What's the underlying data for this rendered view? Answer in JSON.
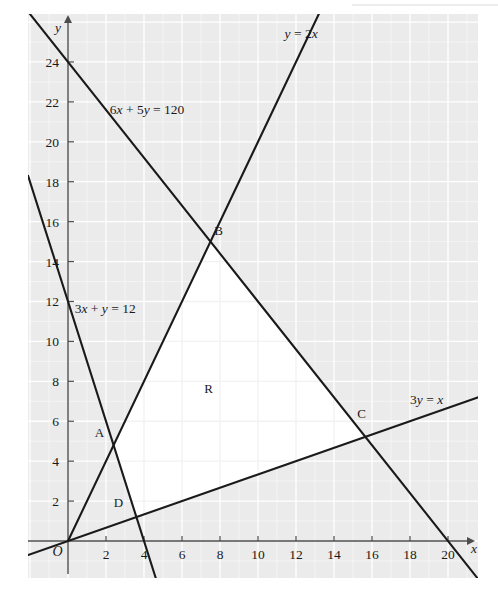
{
  "chart_data": {
    "type": "line",
    "title": "",
    "xlabel": "x",
    "ylabel": "y",
    "xlim": [
      -2.1,
      21.6
    ],
    "ylim": [
      -1.35,
      26.4
    ],
    "grid": true,
    "minor_grid": true,
    "legend": "none",
    "xticks": [
      0,
      2,
      4,
      6,
      8,
      10,
      12,
      14,
      16,
      18,
      20
    ],
    "xtick_labels": [
      "O",
      "2",
      "4",
      "6",
      "8",
      "10",
      "12",
      "14",
      "16",
      "18",
      "20"
    ],
    "yticks": [
      2,
      4,
      6,
      8,
      10,
      12,
      14,
      16,
      18,
      20,
      22,
      24
    ],
    "ytick_labels": [
      "2",
      "4",
      "6",
      "8",
      "10",
      "12",
      "14",
      "16",
      "18",
      "20",
      "22",
      "24"
    ],
    "series": [
      {
        "name": "y = 2x",
        "label": "y = 2x",
        "label_parts": {
          "lhs": "y",
          "eq": "=",
          "rhs_coef": "2",
          "rhs_var": "x"
        },
        "equation": "y = 2x",
        "slope": 2,
        "intercept": 0,
        "points": [
          [
            0,
            0
          ],
          [
            13.2,
            26.4
          ]
        ],
        "label_xy": [
          11.4,
          25.2
        ]
      },
      {
        "name": "6x + 5y = 120",
        "label": "6x + 5y = 120",
        "label_parts": {
          "a": "6",
          "av": "x",
          "plus": "+",
          "b": "5",
          "bv": "y",
          "eq": "=",
          "c": "120"
        },
        "equation": "6x + 5y = 120",
        "slope": -1.2,
        "intercept": 24,
        "points": [
          [
            -2.1,
            26.52
          ],
          [
            21.6,
            -1.92
          ]
        ],
        "label_xy": [
          2.2,
          21.4
        ]
      },
      {
        "name": "3x + y = 12",
        "label": "3x + y = 12",
        "label_parts": {
          "a": "3",
          "av": "x",
          "plus": "+",
          "bv": "y",
          "eq": "=",
          "c": "12"
        },
        "equation": "3x + y = 12",
        "slope": -3,
        "intercept": 12,
        "points": [
          [
            -2.1,
            18.3
          ],
          [
            5.0,
            -3.0
          ]
        ],
        "label_xy": [
          0.35,
          11.4
        ]
      },
      {
        "name": "3y = x",
        "label": "3y = x",
        "label_parts": {
          "a": "3",
          "av": "y",
          "eq": "=",
          "bv": "x"
        },
        "equation": "3y = x",
        "slope": 0.3333,
        "intercept": 0,
        "points": [
          [
            -2.1,
            -0.7
          ],
          [
            21.6,
            7.2
          ]
        ],
        "label_xy": [
          18.0,
          6.85
        ]
      }
    ],
    "region": {
      "label": "R",
      "label_xy": [
        7.4,
        7.4
      ],
      "fill": "#ffffff",
      "vertices": [
        {
          "name": "A",
          "x": 2.4,
          "y": 4.8,
          "label_offset": [
            -0.75,
            0.42
          ]
        },
        {
          "name": "B",
          "x": 7.5,
          "y": 15.0,
          "label_offset": [
            0.42,
            0.32
          ]
        },
        {
          "name": "C",
          "x": 15.652,
          "y": 5.217,
          "label_offset": [
            -0.2,
            0.95
          ]
        },
        {
          "name": "D",
          "x": 3.6,
          "y": 1.2,
          "label_offset": [
            -0.95,
            0.48
          ]
        }
      ]
    },
    "annotations": [
      {
        "text": "O",
        "role": "origin-label",
        "x": -0.55,
        "y": -0.75
      }
    ],
    "colors": {
      "plot_background": "#ebebeb",
      "region_fill": "#ffffff",
      "major_grid": "#ffffff",
      "minor_grid": "#f4f4f4",
      "axis": "#4d4d4d",
      "line": "#1a1a1a",
      "text": "#1a1a1a",
      "page_background": "#ffffff"
    }
  }
}
